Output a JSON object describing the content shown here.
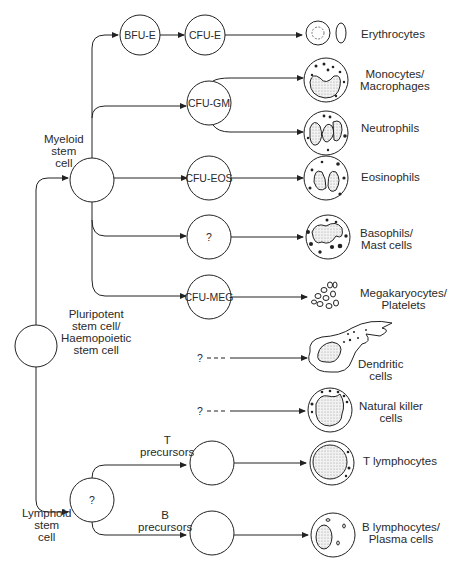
{
  "diagram": {
    "root": {
      "label": "Pluripotent\nstem cell/\nHaemopoietic\nstem cell"
    },
    "myeloid": {
      "label": "Myeloid\nstem\ncell"
    },
    "lymphoid": {
      "label": "Lymphoid\nstem\ncell",
      "node_text": "?"
    },
    "progenitors": {
      "bfu_e": "BFU-E",
      "cfu_e": "CFU-E",
      "cfu_gm": "CFU-GM",
      "cfu_eos": "CFU-EOS",
      "unknown_baso": "?",
      "cfu_meg": "CFU-MEG",
      "t_precursors": "T\nprecursors",
      "b_precursors": "B\nprecursors"
    },
    "dashed_sources": {
      "dendritic": "?",
      "nk": "?"
    },
    "outputs": [
      {
        "id": "erythrocytes",
        "label": "Erythrocytes"
      },
      {
        "id": "monocytes",
        "label": "Monocytes/\nMacrophages"
      },
      {
        "id": "neutrophils",
        "label": "Neutrophils"
      },
      {
        "id": "eosinophils",
        "label": "Eosinophils"
      },
      {
        "id": "basophils",
        "label": "Basophils/\nMast cells"
      },
      {
        "id": "megakaryocytes",
        "label": "Megakaryocytes/\nPlatelets"
      },
      {
        "id": "dendritic",
        "label": "Dendritic\ncells"
      },
      {
        "id": "nk",
        "label": "Natural killer\ncells"
      },
      {
        "id": "t_lymph",
        "label": "T lymphocytes"
      },
      {
        "id": "b_lymph",
        "label": "B lymphocytes/\nPlasma cells"
      }
    ]
  }
}
